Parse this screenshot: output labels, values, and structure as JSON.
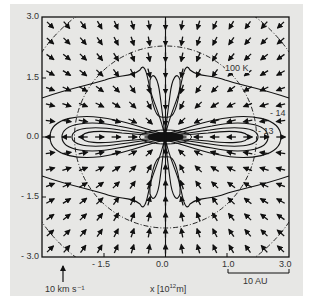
{
  "chart_data": {
    "type": "vector-field-contour",
    "title": "",
    "xlabel": "x [10^12 m]",
    "ylabel": "",
    "xlim": [
      -3.0,
      3.0
    ],
    "ylim": [
      -3.0,
      3.0
    ],
    "x_ticks": [
      "-1.5",
      "0.0",
      "1.0",
      "3.0"
    ],
    "y_ticks": [
      "3.0",
      "1.5",
      "0.0",
      "- 1.5",
      "- 3.0"
    ],
    "grid": false,
    "legend": null,
    "annotations": {
      "contour_labels": [
        "100 K",
        "- 14",
        "- 13"
      ],
      "velocity_scale": "10 km s⁻¹",
      "distance_scale": "10 AU"
    },
    "dashed_circles": [
      {
        "radius": 2.2,
        "style": "dash-dot"
      },
      {
        "radius": 3.6,
        "style": "dash-dot"
      }
    ],
    "vector_field": {
      "description": "Infall velocity arrows on a ~15x15 grid pointing inward toward the origin, with outflow near midplane edges",
      "grid_size": 15
    }
  },
  "labels": {
    "y_top": "3.0",
    "y_mid_up": "1.5",
    "y_zero": "0.0",
    "y_mid_down": "- 1.5",
    "y_bottom": "- 3.0",
    "x_neg": "- 1.5",
    "x_zero": "0.0",
    "x_one": "1.0",
    "x_three": "3.0",
    "x_axis_title_pre": "x [10",
    "x_axis_title_sup": "12",
    "x_axis_title_post": "m]",
    "velocity_scale": "10 km s⁻¹",
    "distance_scale": "10 AU",
    "contour_100k": "100 K",
    "contour_14": "- 14",
    "contour_13": "- 13"
  }
}
